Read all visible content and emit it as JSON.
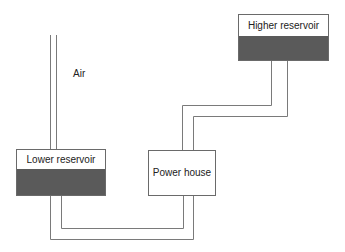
{
  "diagram": {
    "labels": {
      "air": "Air",
      "higher_reservoir": "Higher reservoir",
      "lower_reservoir": "Lower reservoir",
      "power_house": "Power house"
    },
    "colors": {
      "line": "#7a7a7a",
      "water": "#5a5a5a",
      "background": "#ffffff"
    }
  }
}
